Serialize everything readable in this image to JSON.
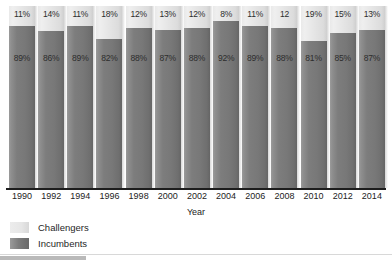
{
  "chart_data": {
    "type": "bar",
    "subtype": "stacked-100-percent",
    "title": "",
    "xlabel": "Year",
    "ylabel": "",
    "ylim": [
      0,
      100
    ],
    "grid": false,
    "legend_position": "bottom-left",
    "categories": [
      "1990",
      "1992",
      "1994",
      "1996",
      "1998",
      "2000",
      "2002",
      "2004",
      "2006",
      "2008",
      "2010",
      "2012",
      "2014"
    ],
    "series": [
      {
        "name": "Challengers",
        "color": "#e6e6e6",
        "values": [
          11,
          14,
          11,
          18,
          12,
          13,
          12,
          8,
          11,
          12,
          19,
          15,
          13
        ],
        "labels": [
          "11%",
          "14%",
          "11%",
          "18%",
          "12%",
          "13%",
          "12%",
          "8%",
          "11%",
          "12",
          "19%",
          "15%",
          "13%"
        ]
      },
      {
        "name": "Incumbents",
        "color": "#7a7a7a",
        "values": [
          89,
          86,
          89,
          82,
          88,
          87,
          88,
          92,
          89,
          88,
          81,
          85,
          87
        ],
        "labels": [
          "89%",
          "86%",
          "89%",
          "82%",
          "88%",
          "87%",
          "88%",
          "92%",
          "89%",
          "88%",
          "81%",
          "85%",
          "87%"
        ]
      }
    ]
  },
  "legend": {
    "items": [
      {
        "label": "Challengers",
        "swatch": "challengers"
      },
      {
        "label": "Incumbents",
        "swatch": "incumbents"
      }
    ]
  },
  "axis": {
    "x_title": "Year"
  }
}
